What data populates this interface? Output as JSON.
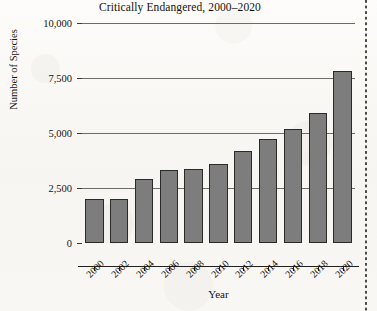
{
  "chart_data": {
    "type": "bar",
    "title": "Critically Endangered, 2000–2020",
    "xlabel": "Year",
    "ylabel": "Number of Species",
    "categories": [
      "2000",
      "2002",
      "2004",
      "2006",
      "2008",
      "2010",
      "2012",
      "2014",
      "2016",
      "2018",
      "2020"
    ],
    "values": [
      2000,
      2000,
      2900,
      3300,
      3350,
      3600,
      4200,
      4750,
      5200,
      5900,
      7800
    ],
    "ylim": [
      0,
      10000
    ],
    "yticks": [
      0,
      2500,
      5000,
      7500,
      10000
    ],
    "ytick_labels": [
      "0",
      "2,500",
      "5,000",
      "7,500",
      "10,000"
    ],
    "grid": "horizontal",
    "legend": "none",
    "bar_color": "#7d7d7d",
    "bar_edge_color": "#2a2a28",
    "gridline_color": "#6f6c66",
    "axis_color": "#21201d",
    "text_color": "#15120e"
  },
  "page": {
    "background_color": "#fbfaf7",
    "edge_marker": "dotted-vertical-rule"
  }
}
